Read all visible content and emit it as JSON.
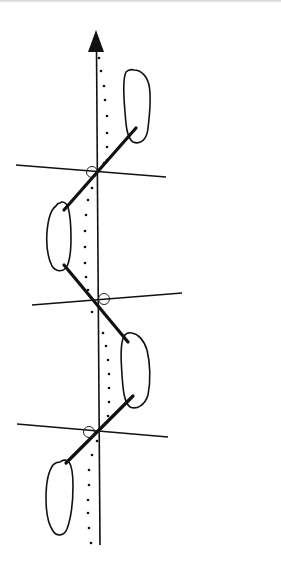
{
  "diagram": {
    "colors": {
      "ink": "#111111",
      "background": "#ffffff"
    },
    "axis": {
      "type": "line-of-progression",
      "direction": "up",
      "arrow": true
    },
    "dotted_line": {
      "description": "foot axis centerline (dotted)"
    },
    "footprints": [
      {
        "side": "right",
        "order": 1,
        "position": "top"
      },
      {
        "side": "left",
        "order": 2,
        "position": "upper-middle"
      },
      {
        "side": "right",
        "order": 3,
        "position": "lower-middle"
      },
      {
        "side": "left",
        "order": 4,
        "position": "bottom"
      }
    ],
    "step_lines": 3,
    "transverse_lines": 3,
    "intersection_markers": 3
  }
}
